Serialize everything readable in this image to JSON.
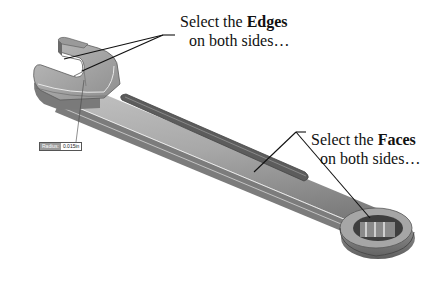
{
  "figure": {
    "colors": {
      "background": "#ffffff",
      "body_light": "#b8b8b8",
      "body_mid": "#9c9c9c",
      "body_dark": "#6e6e6e",
      "groove": "#5a5a5a",
      "leader": "#111111"
    }
  },
  "callouts": {
    "edges": {
      "line1_prefix": "Select the ",
      "line1_bold": "Edges",
      "line2": "on both sides…"
    },
    "faces": {
      "line1_prefix": "Select the ",
      "line1_bold": "Faces",
      "line2": "on both sides…"
    }
  },
  "radius_tag": {
    "label": "Radius:",
    "value": "0.015in"
  }
}
